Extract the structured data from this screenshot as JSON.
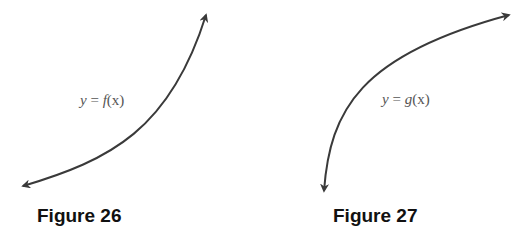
{
  "figures": [
    {
      "id": "figure-26",
      "caption": "Figure 26",
      "label": {
        "var": "y",
        "eq": " = ",
        "fn": "f",
        "arg": "(x)"
      },
      "curve": "increasing, concave up (exponential-like), arrows at both ends"
    },
    {
      "id": "figure-27",
      "caption": "Figure 27",
      "label": {
        "var": "y",
        "eq": " = ",
        "fn": "g",
        "arg": "(x)"
      },
      "curve": "increasing, concave down (logarithmic-like), arrows at both ends"
    }
  ],
  "colors": {
    "curve": "#3a3a3a",
    "label": "#555555",
    "caption": "#111111"
  }
}
